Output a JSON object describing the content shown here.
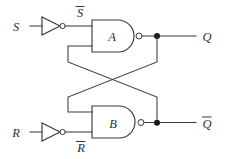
{
  "diagram": {
    "type": "logic-circuit",
    "name": "SR latch built from two cross-coupled NAND gates with inverted inputs",
    "background_color": "#ffffff",
    "line_color": "#3b3b3f",
    "text_color": "#2d2d31"
  },
  "inputs": [
    {
      "id": "s",
      "label": "S",
      "overbar": false,
      "position": "top-left"
    },
    {
      "id": "r",
      "label": "R",
      "overbar": false,
      "position": "bottom-left"
    }
  ],
  "inverters": [
    {
      "id": "inv-s",
      "input": "S",
      "output_label": "S",
      "output_overbar": true,
      "label_position": "above-wire"
    },
    {
      "id": "inv-r",
      "input": "R",
      "output_label": "R",
      "output_overbar": true,
      "label_position": "below-wire"
    }
  ],
  "intermediate_labels": [
    {
      "id": "s-bar",
      "label": "S",
      "overbar": true
    },
    {
      "id": "r-bar",
      "label": "R",
      "overbar": true
    }
  ],
  "gates": [
    {
      "id": "gate-a",
      "label": "A",
      "type": "NAND",
      "inputs": 2,
      "position": "top"
    },
    {
      "id": "gate-b",
      "label": "B",
      "type": "NAND",
      "inputs": 2,
      "position": "bottom"
    }
  ],
  "outputs": [
    {
      "id": "q",
      "label": "Q",
      "overbar": false,
      "source": "gate-a",
      "position": "top-right"
    },
    {
      "id": "q-bar",
      "label": "Q",
      "overbar": true,
      "source": "gate-b",
      "position": "bottom-right"
    }
  ],
  "junctions": [
    {
      "id": "junction-q",
      "x": 157,
      "y": 36
    },
    {
      "id": "junction-qbar",
      "x": 157,
      "y": 123
    }
  ],
  "feedback": [
    {
      "id": "feedback-q-to-b",
      "from": "junction-q",
      "to": "gate-b-input-1"
    },
    {
      "id": "feedback-qbar-to-a",
      "from": "junction-qbar",
      "to": "gate-a-input-2"
    }
  ]
}
